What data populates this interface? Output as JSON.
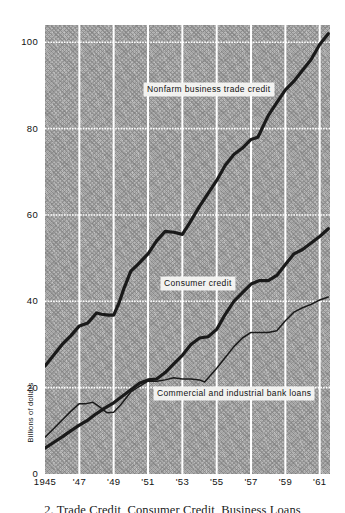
{
  "figure": {
    "caption": "2. Trade Credit, Consumer Credit, Business Loans"
  },
  "chart_data": {
    "type": "line",
    "title": "",
    "subtitle": "",
    "xlabel": "",
    "ylabel": "Billions of dollars",
    "xlim": [
      1945,
      1961.6
    ],
    "ylim": [
      0,
      104
    ],
    "grid": true,
    "legend_position": "in-plot-callouts",
    "y_ticks": [
      0,
      20,
      40,
      60,
      80,
      100
    ],
    "y_tick_labels": [
      "0",
      "20",
      "40",
      "60",
      "80",
      "100"
    ],
    "x_ticks": [
      1945,
      1947,
      1949,
      1951,
      1953,
      1955,
      1957,
      1959,
      1961
    ],
    "x_tick_labels": [
      "1945",
      "'47",
      "'49",
      "'51",
      "'53",
      "'55",
      "'57",
      "'59",
      "'61"
    ],
    "series": [
      {
        "name": "Nonfarm business trade credit",
        "style": "thick",
        "color": "#1a1a1a",
        "x": [
          1945.0,
          1945.5,
          1946.0,
          1946.5,
          1947.0,
          1947.5,
          1948.0,
          1948.3,
          1948.7,
          1949.0,
          1949.3,
          1949.6,
          1950.0,
          1950.4,
          1951.0,
          1951.5,
          1952.0,
          1952.5,
          1953.0,
          1953.4,
          1954.0,
          1954.5,
          1955.0,
          1955.5,
          1956.0,
          1956.5,
          1957.0,
          1957.4,
          1958.0,
          1958.5,
          1959.0,
          1959.5,
          1960.0,
          1960.5,
          1961.0,
          1961.5
        ],
        "y": [
          25.0,
          27.5,
          30.0,
          32.0,
          34.3,
          35.0,
          37.3,
          37.0,
          36.8,
          36.8,
          39.5,
          43.0,
          47.0,
          48.5,
          51.0,
          54.0,
          56.2,
          56.0,
          55.5,
          58.0,
          62.0,
          65.0,
          68.0,
          71.5,
          74.0,
          75.5,
          77.5,
          78.0,
          83.0,
          86.0,
          89.0,
          91.0,
          93.5,
          96.0,
          99.5,
          102.0
        ]
      },
      {
        "name": "Consumer credit",
        "style": "thick",
        "color": "#1a1a1a",
        "x": [
          1945.0,
          1945.5,
          1946.0,
          1946.5,
          1947.0,
          1947.5,
          1948.0,
          1948.5,
          1949.0,
          1949.5,
          1950.0,
          1950.5,
          1951.0,
          1951.5,
          1952.0,
          1952.5,
          1953.0,
          1953.5,
          1954.0,
          1954.5,
          1955.0,
          1955.5,
          1956.0,
          1956.5,
          1957.0,
          1957.5,
          1958.0,
          1958.5,
          1959.0,
          1959.5,
          1960.0,
          1960.5,
          1961.0,
          1961.5
        ],
        "y": [
          6.0,
          7.3,
          8.6,
          10.0,
          11.3,
          12.5,
          14.0,
          15.3,
          16.5,
          18.0,
          19.5,
          21.0,
          21.8,
          22.0,
          23.5,
          25.5,
          27.5,
          30.0,
          31.5,
          31.8,
          33.5,
          37.0,
          40.0,
          42.0,
          44.0,
          44.8,
          44.8,
          46.0,
          48.5,
          51.0,
          52.0,
          53.5,
          55.0,
          56.8
        ]
      },
      {
        "name": "Commercial and industrial bank loans",
        "style": "thin",
        "color": "#1a1a1a",
        "x": [
          1945.0,
          1945.5,
          1946.0,
          1946.5,
          1947.0,
          1947.4,
          1947.8,
          1948.2,
          1948.6,
          1949.0,
          1949.4,
          1950.0,
          1950.5,
          1951.0,
          1951.5,
          1952.0,
          1952.5,
          1953.0,
          1953.5,
          1954.0,
          1954.3,
          1955.0,
          1955.5,
          1956.0,
          1956.5,
          1957.0,
          1957.5,
          1958.0,
          1958.5,
          1959.0,
          1959.5,
          1960.0,
          1960.5,
          1961.0,
          1961.5
        ],
        "y": [
          8.5,
          10.5,
          12.5,
          14.5,
          16.3,
          16.3,
          16.6,
          15.5,
          14.2,
          14.3,
          16.0,
          19.0,
          20.3,
          21.5,
          21.5,
          21.8,
          22.3,
          22.0,
          22.0,
          21.8,
          21.3,
          24.5,
          27.0,
          29.5,
          31.5,
          32.8,
          32.8,
          32.8,
          33.2,
          35.5,
          37.5,
          38.5,
          39.3,
          40.3,
          41.0
        ]
      }
    ],
    "annotations": [
      {
        "text": "Nonfarm business trade credit",
        "x": 1949.6,
        "y": 86
      },
      {
        "text": "Consumer credit",
        "x": 1950.7,
        "y": 42.8
      },
      {
        "text": "Commercial and industrial bank loans",
        "x": 1950.3,
        "y": 19.4
      }
    ]
  },
  "colors": {
    "plot_background": "#b9b9b9",
    "gridline": "#ffffff",
    "line": "#1a1a1a",
    "label_background": "#f2f2f0",
    "text": "#111111"
  }
}
